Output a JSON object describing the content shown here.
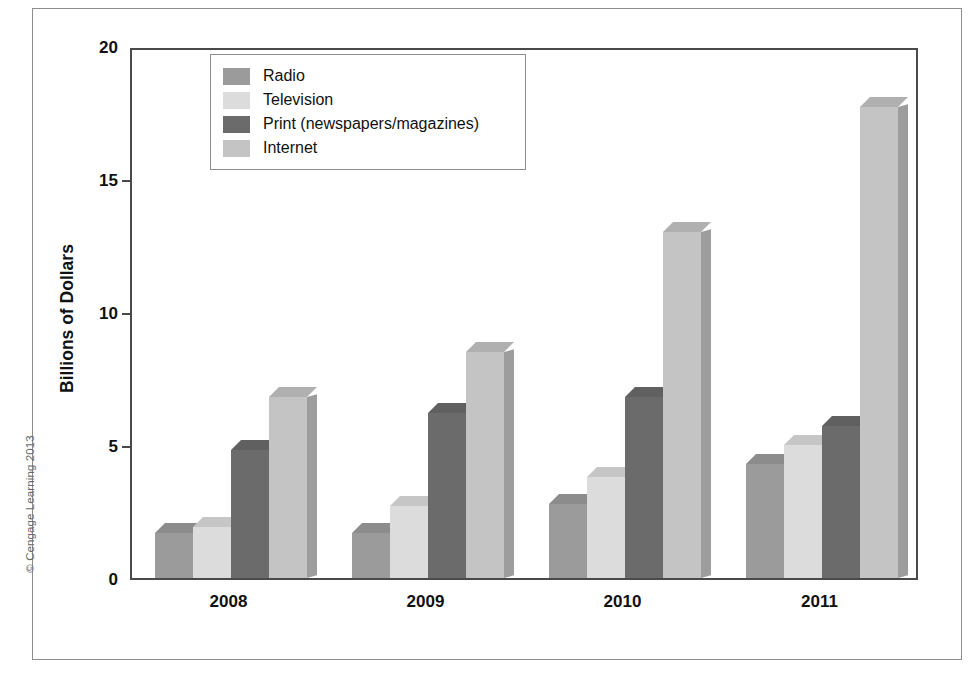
{
  "figure": {
    "copyright": "© Cengage Learning 2013"
  },
  "chart_data": {
    "type": "bar",
    "title": "",
    "xlabel": "",
    "ylabel": "Billions of Dollars",
    "categories": [
      "2008",
      "2009",
      "2010",
      "2011"
    ],
    "ylim": [
      0,
      20
    ],
    "yticks": [
      "0",
      "5",
      "10",
      "15",
      "20"
    ],
    "ytick_values": [
      0,
      5,
      10,
      15,
      20
    ],
    "grid": false,
    "legend_position": "top-left-inside",
    "style": "3d-column",
    "series": [
      {
        "name": "Radio",
        "color": "#9b9b9b",
        "values": [
          1.7,
          1.7,
          2.8,
          4.3
        ]
      },
      {
        "name": "Television",
        "color": "#dcdcdc",
        "values": [
          1.9,
          2.7,
          3.8,
          5.0
        ]
      },
      {
        "name": "Print (newspapers/magazines)",
        "color": "#6b6b6b",
        "values": [
          4.8,
          6.2,
          6.8,
          5.7
        ]
      },
      {
        "name": "Internet",
        "color": "#c4c4c4",
        "values": [
          6.8,
          8.5,
          13.0,
          17.7
        ]
      }
    ]
  }
}
